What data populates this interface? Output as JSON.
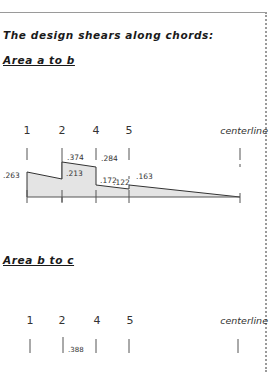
{
  "heading": "The design shears along chords:",
  "sections": [
    {
      "title": "Area a to b",
      "stations": [
        "1",
        "2",
        "4",
        "5",
        "centerline"
      ],
      "values": {
        "s1_left": ".263",
        "s2_right": ".213",
        "s2_top": ".374",
        "s4_top": ".284",
        "s4_right": ".172",
        "s5_left": ".122",
        "s5_right": ".163"
      }
    },
    {
      "title": "Area b to c",
      "stations": [
        "1",
        "2",
        "4",
        "5",
        "centerline"
      ],
      "values": {
        "s2_top": ".388"
      }
    }
  ],
  "colors": {
    "fill": "#e4e4e4",
    "line": "#333333",
    "border": "#9a9a9a"
  }
}
